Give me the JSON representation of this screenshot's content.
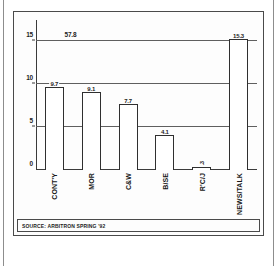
{
  "chart_data": {
    "type": "bar",
    "title": "",
    "subtitle": "",
    "xlabel": "",
    "ylabel": "",
    "categories": [
      "CONT'Y",
      "MOR",
      "C&W",
      "B/SE",
      "R'C/J",
      "NEWS/TALK"
    ],
    "values": [
      9.7,
      9.1,
      7.7,
      4.1,
      0.3,
      15.3
    ],
    "value_labels": [
      "9.7",
      "9.1",
      "7.7",
      "4.1",
      ".3",
      "15.3"
    ],
    "ylim": [
      0,
      17.5
    ],
    "yticks": [
      0,
      5,
      10,
      15
    ],
    "ytick_labels": [
      "0",
      "5",
      "10",
      "15"
    ],
    "grid": true,
    "legend": "none",
    "annotations": [
      {
        "text": "57.8",
        "y": 15,
        "x_frac": 0.12
      }
    ]
  },
  "source": {
    "text": "SOURCE: ARBITRON SPRING '92"
  },
  "colors": {
    "frame": "#4a4a4a",
    "axis": "#3b3b3b",
    "grid": "#5f5f5f",
    "bar_fill": "#ffffff",
    "bar_stroke": "#2f2f2f",
    "text": "#1d1d1d",
    "page_bg": "#ffffff",
    "outer_bg": "#b9b9b9"
  }
}
